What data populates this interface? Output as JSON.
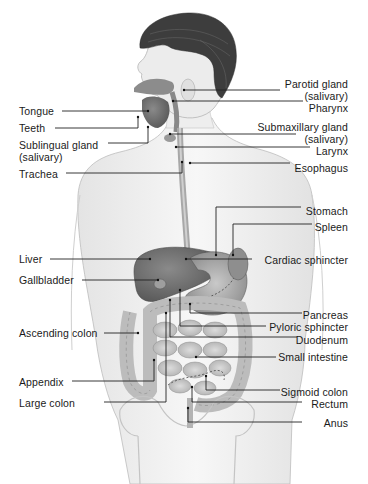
{
  "diagram": {
    "colors": {
      "skin": "#f0f0f0",
      "outline": "#b8b8b8",
      "organ_dark": "#6a6a6a",
      "organ_mid": "#9a9a9a",
      "organ_light": "#c8c8c8",
      "hair": "#3a3a3a",
      "leader": "#222222"
    },
    "labels_left": [
      {
        "id": "tongue",
        "text": "Tongue"
      },
      {
        "id": "teeth",
        "text": "Teeth"
      },
      {
        "id": "sublingual",
        "text": "Sublingual gland",
        "sub": "(salivary)"
      },
      {
        "id": "trachea",
        "text": "Trachea"
      },
      {
        "id": "liver",
        "text": "Liver"
      },
      {
        "id": "gallbladder",
        "text": "Gallbladder"
      },
      {
        "id": "ascending-colon",
        "text": "Ascending colon"
      },
      {
        "id": "appendix",
        "text": "Appendix"
      },
      {
        "id": "large-colon",
        "text": "Large colon"
      }
    ],
    "labels_right": [
      {
        "id": "parotid",
        "text": "Parotid gland",
        "sub": "(salivary)"
      },
      {
        "id": "pharynx",
        "text": "Pharynx"
      },
      {
        "id": "submaxillary",
        "text": "Submaxillary gland",
        "sub": "(salivary)"
      },
      {
        "id": "larynx",
        "text": "Larynx"
      },
      {
        "id": "esophagus",
        "text": "Esophagus"
      },
      {
        "id": "stomach",
        "text": "Stomach"
      },
      {
        "id": "spleen",
        "text": "Spleen"
      },
      {
        "id": "cardiac-sphincter",
        "text": "Cardiac sphincter"
      },
      {
        "id": "pancreas",
        "text": "Pancreas"
      },
      {
        "id": "pyloric-sphincter",
        "text": "Pyloric sphincter"
      },
      {
        "id": "duodenum",
        "text": "Duodenum"
      },
      {
        "id": "small-intestine",
        "text": "Small intestine"
      },
      {
        "id": "sigmoid-colon",
        "text": "Sigmoid colon"
      },
      {
        "id": "rectum",
        "text": "Rectum"
      },
      {
        "id": "anus",
        "text": "Anus"
      }
    ]
  }
}
